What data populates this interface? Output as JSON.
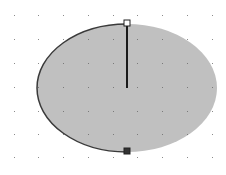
{
  "canvas": {
    "background": "#ffffff",
    "grid": {
      "dot_color": "#8a8a8a",
      "columns_x": [
        14,
        38,
        63,
        88,
        113,
        137,
        162,
        187,
        212
      ],
      "rows_y": [
        15,
        39,
        63,
        87,
        111,
        134,
        157
      ]
    },
    "shape": {
      "type": "ellipse",
      "fill": "#c0c0c0",
      "cx": 127,
      "cy": 88,
      "rx": 90,
      "ry": 64,
      "outline_arc_color": "#3a3a3a",
      "radius_line_color": "#1a1a1a"
    },
    "handles": [
      {
        "name": "top-handle",
        "x": 127,
        "y": 23,
        "filled": false
      },
      {
        "name": "bottom-handle",
        "x": 127,
        "y": 151,
        "filled": true
      }
    ]
  }
}
